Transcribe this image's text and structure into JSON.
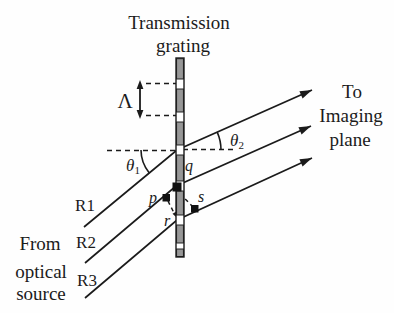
{
  "title": {
    "line1": "Transmission",
    "line2": "grating"
  },
  "grating": {
    "period_symbol": "Λ"
  },
  "angles": {
    "incident": {
      "symbol": "θ",
      "sub": "1"
    },
    "diffracted": {
      "symbol": "θ",
      "sub": "2"
    }
  },
  "rays": [
    {
      "label": "R1"
    },
    {
      "label": "R2"
    },
    {
      "label": "R3"
    }
  ],
  "points": {
    "p": "p",
    "q": "q",
    "r": "r",
    "s": "s"
  },
  "source_caption": {
    "line1": "From",
    "line2": "optical",
    "line3": "source"
  },
  "destination_caption": {
    "line1": "To",
    "line2": "Imaging",
    "line3": "plane"
  },
  "colors": {
    "ink": "#1b1b1b",
    "grating_fill": "#979797",
    "background": "#fefefe"
  }
}
